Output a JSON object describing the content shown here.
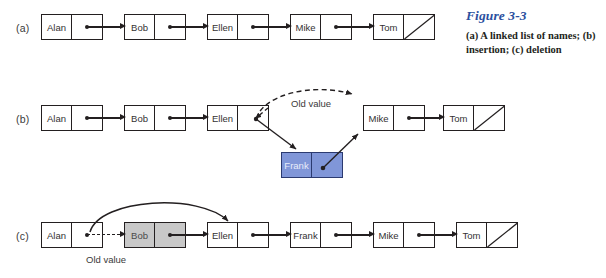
{
  "figure": {
    "title": "Figure 3-3",
    "description": "(a) A linked list of names; (b) insertion; (c) deletion",
    "title_color": "#2b4f9e",
    "highlight_blue": "#8096d8",
    "highlight_grey": "#c8c8c8",
    "line_color": "#231f20"
  },
  "rows": [
    {
      "id": "a",
      "label": "(a)",
      "caption_note": "A linked list of names",
      "nodes": [
        {
          "name": "Alan",
          "x": 41,
          "y": 14,
          "fill": "white",
          "pointer": "next"
        },
        {
          "name": "Bob",
          "x": 124,
          "y": 14,
          "fill": "white",
          "pointer": "next"
        },
        {
          "name": "Ellen",
          "x": 207,
          "y": 14,
          "fill": "white",
          "pointer": "next"
        },
        {
          "name": "Mike",
          "x": 290,
          "y": 14,
          "fill": "white",
          "pointer": "next"
        },
        {
          "name": "Tom",
          "x": 373,
          "y": 14,
          "fill": "white",
          "pointer": "null"
        }
      ],
      "arrows": [
        {
          "kind": "straight",
          "from": "Alan",
          "to": "Bob"
        },
        {
          "kind": "straight",
          "from": "Bob",
          "to": "Ellen"
        },
        {
          "kind": "straight",
          "from": "Ellen",
          "to": "Mike"
        },
        {
          "kind": "straight",
          "from": "Mike",
          "to": "Tom"
        }
      ],
      "annotations": []
    },
    {
      "id": "b",
      "label": "(b)",
      "caption_note": "insertion",
      "nodes": [
        {
          "name": "Alan",
          "x": 41,
          "y": 105,
          "fill": "white",
          "pointer": "next"
        },
        {
          "name": "Bob",
          "x": 124,
          "y": 105,
          "fill": "white",
          "pointer": "next"
        },
        {
          "name": "Ellen",
          "x": 207,
          "y": 105,
          "fill": "white",
          "pointer": "next"
        },
        {
          "name": "Mike",
          "x": 363,
          "y": 105,
          "fill": "white",
          "pointer": "next"
        },
        {
          "name": "Tom",
          "x": 443,
          "y": 105,
          "fill": "white",
          "pointer": "null"
        },
        {
          "name": "Frank",
          "x": 281,
          "y": 152,
          "fill": "blue",
          "pointer": "next"
        }
      ],
      "arrows": [
        {
          "kind": "straight",
          "from": "Alan",
          "to": "Bob"
        },
        {
          "kind": "straight",
          "from": "Bob",
          "to": "Ellen"
        },
        {
          "kind": "curved-dashed",
          "from": "Ellen",
          "to": "Mike",
          "note": "old value"
        },
        {
          "kind": "diagonal",
          "from": "Ellen",
          "to": "Frank"
        },
        {
          "kind": "diagonal",
          "from": "Frank",
          "to": "Mike"
        },
        {
          "kind": "straight",
          "from": "Mike",
          "to": "Tom"
        }
      ],
      "annotations": [
        {
          "text": "Old value",
          "x": 291,
          "y": 98
        }
      ]
    },
    {
      "id": "c",
      "label": "(c)",
      "caption_note": "deletion",
      "nodes": [
        {
          "name": "Alan",
          "x": 41,
          "y": 222,
          "fill": "white",
          "pointer": "next"
        },
        {
          "name": "Bob",
          "x": 124,
          "y": 222,
          "fill": "grey",
          "pointer": "next"
        },
        {
          "name": "Ellen",
          "x": 207,
          "y": 222,
          "fill": "white",
          "pointer": "next"
        },
        {
          "name": "Frank",
          "x": 290,
          "y": 222,
          "fill": "white",
          "pointer": "next"
        },
        {
          "name": "Mike",
          "x": 373,
          "y": 222,
          "fill": "white",
          "pointer": "next"
        },
        {
          "name": "Tom",
          "x": 456,
          "y": 222,
          "fill": "white",
          "pointer": "null"
        }
      ],
      "arrows": [
        {
          "kind": "dashed",
          "from": "Alan",
          "to": "Bob",
          "note": "old value"
        },
        {
          "kind": "curved",
          "from": "Alan",
          "to": "Ellen"
        },
        {
          "kind": "straight",
          "from": "Bob",
          "to": "Ellen"
        },
        {
          "kind": "straight",
          "from": "Ellen",
          "to": "Frank"
        },
        {
          "kind": "straight",
          "from": "Frank",
          "to": "Mike"
        },
        {
          "kind": "straight",
          "from": "Mike",
          "to": "Tom"
        }
      ],
      "annotations": [
        {
          "text": "Old value",
          "x": 86,
          "y": 254
        }
      ]
    }
  ]
}
